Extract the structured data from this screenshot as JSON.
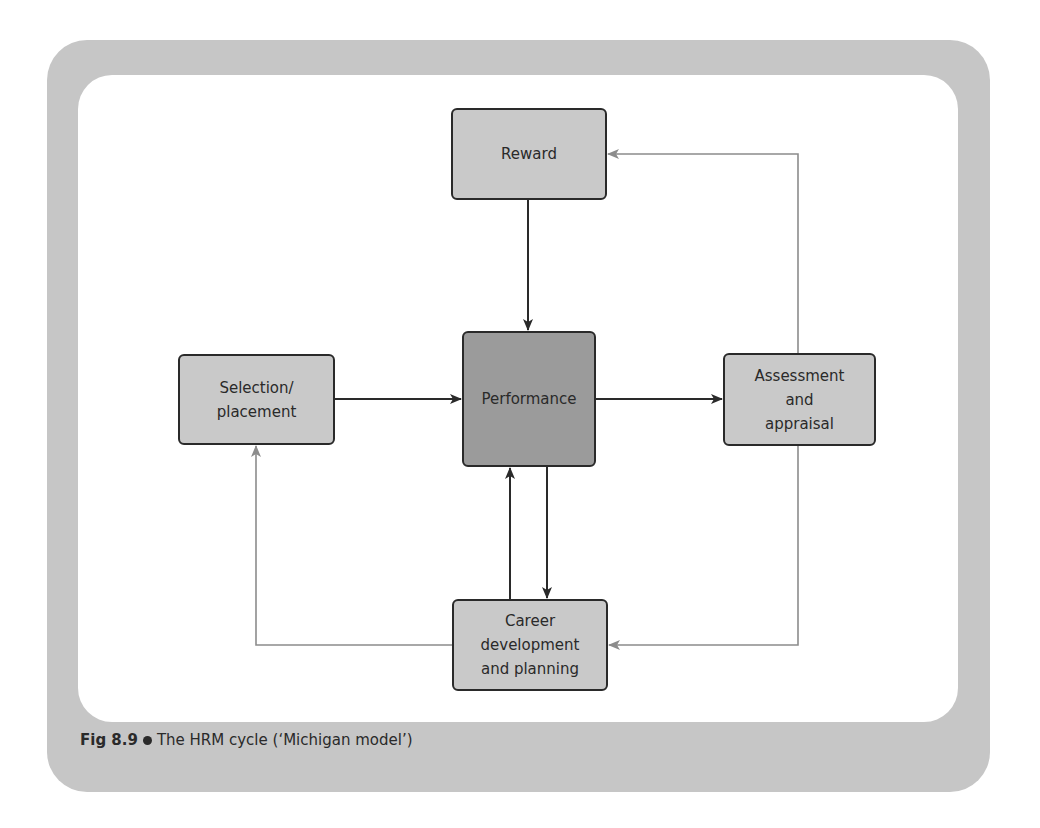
{
  "figure": {
    "caption_label": "Fig 8.9",
    "caption_text": "The HRM cycle (‘Michigan model’)",
    "colors": {
      "frame": "#c6c6c6",
      "box_fill": "#c9c9c9",
      "central_box_fill": "#9b9b9b",
      "primary_arrow": "#2a2a2a",
      "feedback_arrow": "#8c8c8c"
    }
  },
  "nodes": {
    "reward": "Reward",
    "selection": "Selection/\nplacement",
    "performance": "Performance",
    "assessment": "Assessment\nand\nappraisal",
    "career": "Career\ndevelopment\nand planning"
  },
  "edges": [
    {
      "from": "Reward",
      "to": "Performance",
      "style": "primary"
    },
    {
      "from": "Selection/placement",
      "to": "Performance",
      "style": "primary"
    },
    {
      "from": "Performance",
      "to": "Assessment and appraisal",
      "style": "primary"
    },
    {
      "from": "Performance",
      "to": "Career development and planning",
      "style": "primary"
    },
    {
      "from": "Career development and planning",
      "to": "Performance",
      "style": "primary"
    },
    {
      "from": "Assessment and appraisal",
      "to": "Reward",
      "style": "feedback"
    },
    {
      "from": "Assessment and appraisal",
      "to": "Career development and planning",
      "style": "feedback"
    },
    {
      "from": "Career development and planning",
      "to": "Selection/placement",
      "style": "feedback"
    }
  ]
}
